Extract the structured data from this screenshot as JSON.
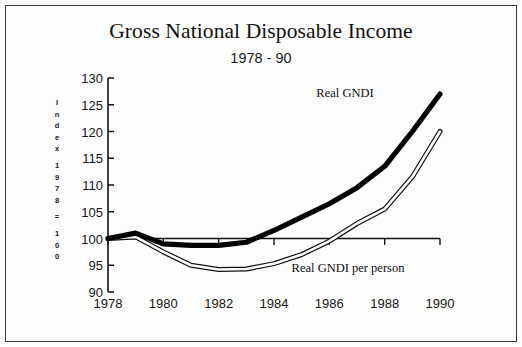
{
  "figure": {
    "title": "Gross National Disposable Income",
    "subtitle": "1978 - 90",
    "border_color": "#3a3a3a",
    "background": "#fdfdfc"
  },
  "axis": {
    "y_title_chars": [
      "I",
      "n",
      "d",
      "e",
      "x",
      "",
      "1",
      "9",
      "7",
      "8",
      "",
      "=",
      "",
      "1",
      "0",
      "0"
    ],
    "y_title_text": "Index 1978 = 100",
    "y_ticks": [
      "130",
      "125",
      "120",
      "115",
      "110",
      "105",
      "100",
      "95",
      "90"
    ],
    "x_ticks": [
      "1978",
      "1980",
      "1982",
      "1984",
      "1986",
      "1988",
      "1990"
    ]
  },
  "labels": {
    "series_1": "Real GNDI",
    "series_2": "Real GNDI per person"
  },
  "chart_data": {
    "type": "line",
    "title": "Gross National Disposable Income",
    "subtitle": "1978 - 90",
    "xlabel": "",
    "ylabel": "Index 1978 = 100",
    "xlim": [
      1978,
      1990
    ],
    "ylim": [
      90,
      130
    ],
    "y_ticks": [
      90,
      95,
      100,
      105,
      110,
      115,
      120,
      125,
      130
    ],
    "x_ticks": [
      1978,
      1980,
      1982,
      1984,
      1986,
      1988,
      1990
    ],
    "grid": false,
    "legend": "inline-annotations",
    "x": [
      1978,
      1979,
      1980,
      1981,
      1982,
      1983,
      1984,
      1985,
      1986,
      1987,
      1988,
      1989,
      1990
    ],
    "series": [
      {
        "name": "Real GNDI",
        "style": "thick-solid-black",
        "color": "#000000",
        "values": [
          100,
          101,
          99,
          98.7,
          98.7,
          99.3,
          101.5,
          104,
          106.5,
          109.5,
          113.5,
          120,
          127
        ]
      },
      {
        "name": "Real GNDI per person",
        "style": "thin-outlined-white",
        "color": "#000000",
        "values": [
          100,
          100.3,
          97.5,
          95,
          94.2,
          94.3,
          95.3,
          97,
          99.5,
          102.8,
          105.5,
          111.5,
          120
        ]
      }
    ]
  }
}
